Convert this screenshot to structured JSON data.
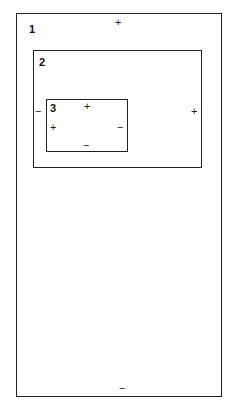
{
  "diagram": {
    "regions": [
      {
        "id": "1",
        "label": "1",
        "signs": {
          "top": "+",
          "bottom": "−"
        }
      },
      {
        "id": "2",
        "label": "2",
        "signs": {
          "left": "−",
          "right": "+"
        }
      },
      {
        "id": "3",
        "label": "3",
        "signs": {
          "top": "+",
          "left": "+",
          "right": "−",
          "bottom": "−"
        }
      }
    ]
  }
}
